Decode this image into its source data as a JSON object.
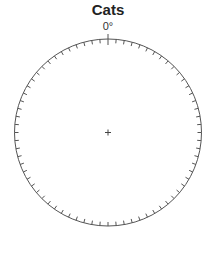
{
  "title": "Cats",
  "dial": {
    "zero_label": "0°",
    "tick_step_degrees": 5,
    "center": [
      108,
      132.5
    ],
    "radius": 93.5,
    "stroke_color": "#555555"
  }
}
